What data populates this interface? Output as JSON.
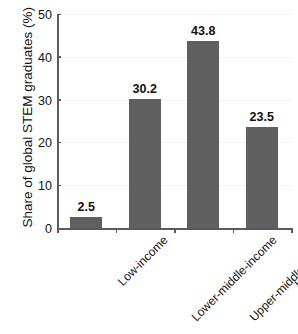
{
  "figure": {
    "title_fragment": "",
    "background": "#ffffff",
    "bar_color": "#5f5f5f",
    "axis_color": "#5a5a5a",
    "grid_color": "#f2f2f2"
  },
  "chart_data": {
    "type": "bar",
    "title": "",
    "xlabel": "",
    "ylabel": "Share of global STEM graduates (%)",
    "categories": [
      "Low-income",
      "Lower-middle-income",
      "Upper-middle-income",
      "High-income"
    ],
    "values": [
      2.5,
      30.2,
      43.8,
      23.5
    ],
    "value_labels": [
      "2.5",
      "30.2",
      "43.8",
      "23.5"
    ],
    "ylim": [
      0,
      50
    ],
    "yticks": [
      0,
      10,
      20,
      30,
      40,
      50
    ],
    "ytick_labels": [
      "0",
      "10",
      "20",
      "30",
      "40",
      "50"
    ],
    "grid": true,
    "legend": null,
    "xtick_label_rotation": 45
  }
}
